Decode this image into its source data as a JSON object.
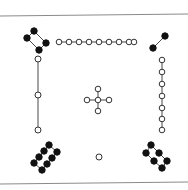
{
  "figure": {
    "colors": {
      "rule": "#8a8a8a",
      "edge": "#333333",
      "filled_node": "#111111",
      "open_node": "#ffffff"
    },
    "rules": [
      {
        "name": "top-rule",
        "x1": 0,
        "y1": 16,
        "x2": 188,
        "y2": 14
      },
      {
        "name": "bottom-rule",
        "x1": 0,
        "y1": 184,
        "x2": 188,
        "y2": 182
      }
    ],
    "components": [
      {
        "name": "top-left-4-cycle-filled",
        "style": "filled",
        "r": 3.2,
        "nodes": [
          [
            34,
            31
          ],
          [
            27,
            38
          ],
          [
            46,
            43
          ],
          [
            39,
            50
          ]
        ],
        "edges": [
          [
            0,
            1
          ],
          [
            0,
            2
          ],
          [
            1,
            3
          ],
          [
            2,
            3
          ]
        ]
      },
      {
        "name": "top-path-9-open",
        "style": "open",
        "r": 2.8,
        "nodes": [
          [
            59,
            42
          ],
          [
            69,
            42
          ],
          [
            79,
            42
          ],
          [
            89,
            42
          ],
          [
            99,
            42
          ],
          [
            109,
            42
          ],
          [
            119,
            42
          ],
          [
            129,
            42
          ],
          [
            134,
            42
          ]
        ],
        "edges": [
          [
            0,
            1
          ],
          [
            1,
            2
          ],
          [
            2,
            3
          ],
          [
            3,
            4
          ],
          [
            4,
            5
          ],
          [
            5,
            6
          ],
          [
            6,
            7
          ],
          [
            7,
            8
          ]
        ]
      },
      {
        "name": "top-right-edge-filled",
        "style": "filled",
        "r": 3.2,
        "nodes": [
          [
            165,
            36
          ],
          [
            153,
            48
          ]
        ],
        "edges": [
          [
            0,
            1
          ]
        ]
      },
      {
        "name": "left-path-3-open",
        "style": "open",
        "r": 3,
        "nodes": [
          [
            38,
            59
          ],
          [
            38,
            95
          ],
          [
            38,
            130
          ]
        ],
        "edges": [
          [
            0,
            1
          ],
          [
            1,
            2
          ]
        ]
      },
      {
        "name": "right-path-7-open",
        "style": "open",
        "r": 2.8,
        "nodes": [
          [
            162,
            60
          ],
          [
            162,
            72
          ],
          [
            162,
            84
          ],
          [
            162,
            96
          ],
          [
            162,
            108
          ],
          [
            162,
            119
          ],
          [
            162,
            130
          ]
        ],
        "edges": [
          [
            0,
            1
          ],
          [
            1,
            2
          ],
          [
            2,
            3
          ],
          [
            3,
            4
          ],
          [
            4,
            5
          ],
          [
            5,
            6
          ]
        ]
      },
      {
        "name": "center-star-open",
        "style": "open",
        "r": 2.8,
        "nodes": [
          [
            98,
            100
          ],
          [
            98,
            89
          ],
          [
            98,
            111
          ],
          [
            87,
            100
          ],
          [
            109,
            100
          ]
        ],
        "edges": [
          [
            0,
            1
          ],
          [
            0,
            2
          ],
          [
            0,
            3
          ],
          [
            0,
            4
          ]
        ]
      },
      {
        "name": "bottom-left-8-cycle-filled",
        "style": "filled",
        "r": 3.2,
        "nodes": [
          [
            49,
            145
          ],
          [
            44,
            151
          ],
          [
            39,
            157
          ],
          [
            34,
            163
          ],
          [
            57,
            152
          ],
          [
            52,
            158
          ],
          [
            47,
            164
          ],
          [
            42,
            170
          ]
        ],
        "edges": [
          [
            0,
            1
          ],
          [
            1,
            2
          ],
          [
            2,
            3
          ],
          [
            4,
            5
          ],
          [
            5,
            6
          ],
          [
            6,
            7
          ],
          [
            0,
            4
          ],
          [
            3,
            7
          ]
        ]
      },
      {
        "name": "bottom-center-isolated-open",
        "style": "open",
        "r": 3,
        "nodes": [
          [
            99,
            157
          ]
        ],
        "edges": []
      },
      {
        "name": "bottom-right-6-cycle-filled",
        "style": "filled",
        "r": 3.2,
        "nodes": [
          [
            151,
            145
          ],
          [
            146,
            153
          ],
          [
            159,
            153
          ],
          [
            154,
            161
          ],
          [
            167,
            161
          ],
          [
            162,
            168
          ]
        ],
        "edges": [
          [
            0,
            1
          ],
          [
            0,
            2
          ],
          [
            1,
            3
          ],
          [
            2,
            4
          ],
          [
            3,
            5
          ],
          [
            4,
            5
          ]
        ]
      }
    ]
  }
}
